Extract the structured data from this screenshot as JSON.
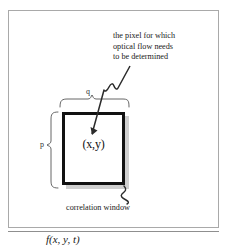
{
  "figure": {
    "annotation": {
      "line1": "the pixel for which",
      "line2": "optical flow needs",
      "line3": "to be determined"
    },
    "pixel_label": "(x,y)",
    "window_caption": "correlation window",
    "dimension_height": "p",
    "dimension_width": "q",
    "formula": "f(x, y, t)",
    "colors": {
      "frame": "#a9a9a9",
      "window_border": "#111111",
      "window_shadow": "#cfcfcf",
      "text": "#1a1a1a",
      "leader": "#2b2b2b",
      "brace": "#555555"
    }
  }
}
